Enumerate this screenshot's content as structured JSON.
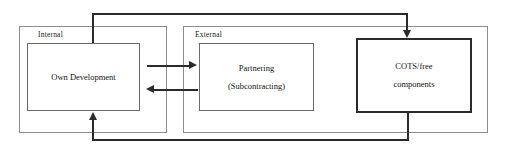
{
  "diagram": {
    "type": "block-flow-diagram",
    "background_color": "#ffffff",
    "line_color": "#2b2b2b",
    "groups": [
      {
        "id": "internal",
        "label": "Internal",
        "x": 19,
        "y": 26,
        "width": 148,
        "height": 107
      },
      {
        "id": "external",
        "label": "External",
        "x": 183,
        "y": 26,
        "width": 305,
        "height": 107
      }
    ],
    "nodes": [
      {
        "id": "own-development",
        "lines": [
          "Own Development"
        ],
        "x": 27,
        "y": 43,
        "width": 113,
        "height": 68,
        "emphasis": "normal"
      },
      {
        "id": "partnering",
        "lines": [
          "Partnering",
          "(Subcontracting)"
        ],
        "x": 199,
        "y": 43,
        "width": 115,
        "height": 68,
        "emphasis": "normal"
      },
      {
        "id": "cots-free-components",
        "lines": [
          "COTS/free",
          "components"
        ],
        "x": 356,
        "y": 38,
        "width": 116,
        "height": 75,
        "emphasis": "bold"
      }
    ],
    "connectors": [
      {
        "id": "own-to-partnering",
        "from": "own-development",
        "to": "partnering",
        "direction": "right"
      },
      {
        "id": "partnering-to-own",
        "from": "partnering",
        "to": "own-development",
        "direction": "left"
      },
      {
        "id": "own-to-cots-top",
        "from": "own-development",
        "to": "cots-free-components",
        "direction": "down"
      },
      {
        "id": "cots-to-own-bottom",
        "from": "cots-free-components",
        "to": "own-development",
        "direction": "up"
      }
    ]
  }
}
